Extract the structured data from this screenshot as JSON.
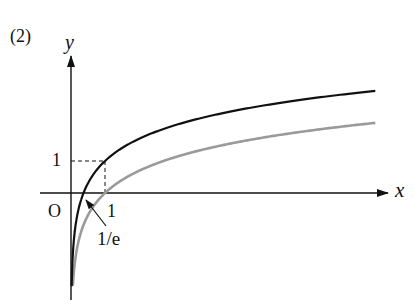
{
  "problem_label": "(2)",
  "chart_data": {
    "type": "line",
    "title": "",
    "xlabel": "x",
    "ylabel": "y",
    "origin_label": "O",
    "x_ticks": [
      {
        "value": 1,
        "label": "1"
      }
    ],
    "y_ticks": [
      {
        "value": 1,
        "label": "1"
      }
    ],
    "annotations": [
      {
        "text": "1/e",
        "points_to": [
          0.3679,
          0
        ],
        "description": "x-intercept of black curve"
      },
      {
        "type": "dashed-guide",
        "from": [
          0,
          1
        ],
        "to": [
          1,
          1
        ]
      },
      {
        "type": "dashed-guide",
        "from": [
          1,
          1
        ],
        "to": [
          1,
          0
        ]
      }
    ],
    "series": [
      {
        "name": "y = log x + 1",
        "color": "#111111",
        "style": "solid-black",
        "x": [
          0.05,
          0.1,
          0.3679,
          0.5,
          1,
          2,
          3,
          4,
          5,
          6,
          7,
          8,
          8.9
        ],
        "values": [
          -2.0,
          -1.3,
          0,
          0.31,
          1,
          1.69,
          2.1,
          2.39,
          2.61,
          2.79,
          2.95,
          3.08,
          3.19
        ]
      },
      {
        "name": "y = log x",
        "color": "#9a9a9a",
        "style": "solid-gray",
        "x": [
          0.1,
          0.2,
          0.5,
          1,
          2,
          3,
          4,
          5,
          6,
          7,
          8,
          8.9
        ],
        "values": [
          -2.3,
          -1.61,
          -0.69,
          0,
          0.69,
          1.1,
          1.39,
          1.61,
          1.79,
          1.95,
          2.08,
          2.19
        ]
      }
    ],
    "xlim": [
      -0.5,
      9.3
    ],
    "ylim": [
      -3.0,
      4.5
    ],
    "grid": false,
    "legend": "none"
  }
}
